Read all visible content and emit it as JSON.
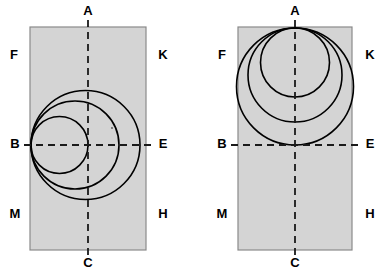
{
  "figure": {
    "type": "geometric-diagram",
    "background_color": "#ffffff",
    "rect_fill_color": "#d4d4d4",
    "rect_stroke_color": "#8a8a8a",
    "circle_stroke_color": "#000000",
    "dashed_line_color": "#1a1a1a",
    "label_color": "#000000"
  },
  "panels": [
    {
      "id": "left-panel",
      "name": "left-diagram",
      "rect": {
        "x": 30,
        "y": 27,
        "width": 116,
        "height": 223
      },
      "axes": {
        "vertical": {
          "x": 88,
          "y1": 12,
          "y2": 264,
          "top_label": "A",
          "bottom_label": "C"
        },
        "horizontal": {
          "y": 145,
          "x1": 22,
          "x2": 155,
          "left_label": "B",
          "right_label": "E"
        }
      },
      "tangency_point": {
        "label": "B",
        "x": 31,
        "y": 145
      },
      "circles": [
        {
          "id": "left-circle-small",
          "cx": 59.5,
          "cy": 145,
          "r": 28.5,
          "right_extent": 88
        },
        {
          "id": "left-circle-medium",
          "cx": 75,
          "cy": 145,
          "r": 44,
          "right_extent": 119
        },
        {
          "id": "left-circle-large",
          "cx": 85.5,
          "cy": 145,
          "r": 54.5,
          "right_extent": 140
        }
      ],
      "labels": [
        {
          "text": "A",
          "x": 88,
          "y": 12,
          "name": "label-A"
        },
        {
          "text": "F",
          "x": 14,
          "y": 56,
          "name": "label-F"
        },
        {
          "text": "K",
          "x": 163,
          "y": 56,
          "name": "label-K"
        },
        {
          "text": "B",
          "x": 15,
          "y": 145,
          "name": "label-B"
        },
        {
          "text": "E",
          "x": 163,
          "y": 145,
          "name": "label-E"
        },
        {
          "text": "M",
          "x": 15,
          "y": 215,
          "name": "label-M"
        },
        {
          "text": "H",
          "x": 163,
          "y": 215,
          "name": "label-H"
        },
        {
          "text": "C",
          "x": 88,
          "y": 264,
          "name": "label-C"
        }
      ]
    },
    {
      "id": "right-panel",
      "name": "right-diagram",
      "rect": {
        "x": 238,
        "y": 27,
        "width": 114,
        "height": 223
      },
      "axes": {
        "vertical": {
          "x": 295,
          "y1": 12,
          "y2": 264,
          "top_label": "A",
          "bottom_label": "C"
        },
        "horizontal": {
          "y": 145,
          "x1": 229,
          "x2": 362,
          "left_label": "B",
          "right_label": "E"
        }
      },
      "tangency_point": {
        "label": "A",
        "x": 295,
        "y": 28
      },
      "circles": [
        {
          "id": "right-circle-small",
          "cx": 295,
          "cy": 62.5,
          "r": 34.5,
          "bottom_extent": 97
        },
        {
          "id": "right-circle-medium",
          "cx": 295,
          "cy": 75,
          "r": 47,
          "bottom_extent": 122
        },
        {
          "id": "right-circle-large",
          "cx": 295,
          "cy": 86.5,
          "r": 58.5,
          "bottom_extent": 145
        }
      ],
      "labels": [
        {
          "text": "A",
          "x": 295,
          "y": 12,
          "name": "label-A"
        },
        {
          "text": "F",
          "x": 222,
          "y": 56,
          "name": "label-F"
        },
        {
          "text": "K",
          "x": 370,
          "y": 56,
          "name": "label-K"
        },
        {
          "text": "B",
          "x": 222,
          "y": 145,
          "name": "label-B"
        },
        {
          "text": "E",
          "x": 370,
          "y": 145,
          "name": "label-E"
        },
        {
          "text": "M",
          "x": 222,
          "y": 215,
          "name": "label-M"
        },
        {
          "text": "H",
          "x": 370,
          "y": 215,
          "name": "label-H"
        },
        {
          "text": "C",
          "x": 295,
          "y": 264,
          "name": "label-C"
        }
      ]
    }
  ]
}
